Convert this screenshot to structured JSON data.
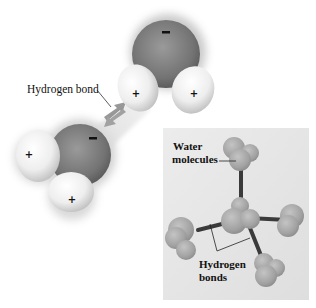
{
  "figure": {
    "main_label": "Hydrogen bond",
    "inset": {
      "label_top_line1": "Water",
      "label_top_line2": "molecules",
      "label_bottom_line1": "Hydrogen",
      "label_bottom_line2": "bonds"
    },
    "charges": {
      "negative": "−",
      "positive": "+"
    },
    "molecules": [
      {
        "name": "water-molecule-top",
        "oxygen_charge": "−",
        "hydrogen_charges": [
          "+",
          "+"
        ]
      },
      {
        "name": "water-molecule-left",
        "oxygen_charge": "−",
        "hydrogen_charges": [
          "+",
          "+"
        ]
      }
    ],
    "colors": {
      "oxygen": "#7a7a7a",
      "hydrogen": "#f2f2f2",
      "bond_arrow": "#8a8a8a",
      "inset_background": "#e6e6e6",
      "inset_sphere": "#a6a6a6",
      "inset_stick": "#3a3a3a"
    }
  }
}
